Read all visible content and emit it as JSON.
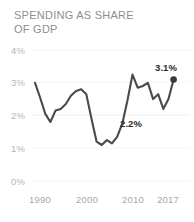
{
  "chart_data": {
    "type": "line",
    "title": "SPENDING AS SHARE\nOF GDP",
    "xlabel": "",
    "ylabel": "",
    "xlim": [
      1990,
      2017
    ],
    "ylim": [
      0,
      4
    ],
    "grid": true,
    "legend_position": "none",
    "line_color": "#4a4a4a",
    "tick_color": "#b5b5b5",
    "label_color": "#2b2b2b",
    "ytick_labels": [
      "4%",
      "3%",
      "2%",
      "1%",
      "0%"
    ],
    "ytick_values": [
      4,
      3,
      2,
      1,
      0
    ],
    "xtick_labels": [
      "1990",
      "2000",
      "2010",
      "2017"
    ],
    "xtick_values": [
      1990,
      2000,
      2010,
      2017
    ],
    "x": [
      1990,
      1991,
      1992,
      1993,
      1994,
      1995,
      1996,
      1997,
      1998,
      1999,
      2000,
      2001,
      2002,
      2003,
      2004,
      2005,
      2006,
      2007,
      2008,
      2009,
      2010,
      2011,
      2012,
      2013,
      2014,
      2015,
      2016,
      2017
    ],
    "values": [
      3.0,
      2.55,
      2.05,
      1.8,
      2.15,
      2.2,
      2.35,
      2.6,
      2.75,
      2.8,
      2.65,
      1.9,
      1.2,
      1.1,
      1.25,
      1.15,
      1.35,
      1.75,
      2.45,
      3.25,
      2.85,
      2.9,
      3.0,
      2.5,
      2.65,
      2.2,
      2.5,
      3.1
    ],
    "annotations": [
      {
        "name": "end-value",
        "text": "3.1%",
        "x": 2017,
        "y": 3.1
      },
      {
        "name": "mid-value",
        "text": "2.2%",
        "x": 2015,
        "y": 2.2
      }
    ],
    "end_marker": {
      "x": 2017,
      "y": 3.1,
      "color": "#3a3a3a"
    }
  }
}
